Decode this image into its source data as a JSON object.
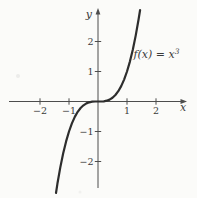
{
  "figure": {
    "background": "#fbfbf9",
    "axis_color": "#4d4d4d",
    "curve_color": "#2d2d2d",
    "text_color": "#3a3a3a",
    "annotation": {
      "base": "f(x) = x",
      "exponent": "3",
      "x": 1.22,
      "y": 1.45
    }
  },
  "chart_data": {
    "type": "line",
    "xlabel": "x",
    "ylabel": "y",
    "xlim": [
      -3.05,
      3.05
    ],
    "ylim": [
      -3.1,
      3.1
    ],
    "grid": false,
    "legend": "none",
    "x_ticks": [
      -2,
      -1,
      1,
      2
    ],
    "y_ticks": [
      2,
      1,
      -1,
      -2
    ],
    "annotations": [
      {
        "text": "f(x) = x³",
        "x": 1.22,
        "y": 1.45
      }
    ],
    "series": [
      {
        "name": "f(x) = x³",
        "x": [
          -1.45,
          -1.4,
          -1.3,
          -1.2,
          -1.1,
          -1.0,
          -0.9,
          -0.8,
          -0.7,
          -0.6,
          -0.5,
          -0.4,
          -0.3,
          -0.2,
          -0.1,
          0,
          0.1,
          0.2,
          0.3,
          0.4,
          0.5,
          0.6,
          0.7,
          0.8,
          0.9,
          1.0,
          1.1,
          1.2,
          1.3,
          1.4,
          1.45
        ],
        "y": [
          -3.049,
          -2.744,
          -2.197,
          -1.728,
          -1.331,
          -1.0,
          -0.729,
          -0.512,
          -0.343,
          -0.216,
          -0.125,
          -0.064,
          -0.027,
          -0.008,
          -0.001,
          0,
          0.001,
          0.008,
          0.027,
          0.064,
          0.125,
          0.216,
          0.343,
          0.512,
          0.729,
          1.0,
          1.331,
          1.728,
          2.197,
          2.744,
          3.049
        ]
      }
    ]
  }
}
